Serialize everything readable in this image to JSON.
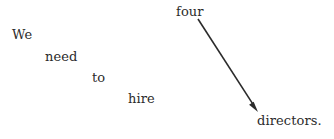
{
  "canvas": {
    "width": 334,
    "height": 139,
    "background_color": "#ffffff",
    "text_color": "#2b2b2b"
  },
  "sentence": {
    "full_text": "We need to hire four directors.",
    "words": [
      {
        "id": "we",
        "text": "We",
        "x": 12,
        "y": 28,
        "font_size": 13
      },
      {
        "id": "need",
        "text": "need",
        "x": 45,
        "y": 50,
        "font_size": 13
      },
      {
        "id": "to",
        "text": "to",
        "x": 92,
        "y": 71,
        "font_size": 13
      },
      {
        "id": "hire",
        "text": "hire",
        "x": 128,
        "y": 92,
        "font_size": 13
      },
      {
        "id": "four",
        "text": "four",
        "x": 176,
        "y": 5,
        "font_size": 13
      },
      {
        "id": "directors",
        "text": "directors.",
        "x": 257,
        "y": 114,
        "font_size": 13
      }
    ]
  },
  "arrow": {
    "id": "four-to-directors-arrow",
    "from_word": "four",
    "to_word": "directors",
    "start_x": 198,
    "start_y": 19,
    "end_x": 258,
    "end_y": 112,
    "stroke_color": "#2b2b2b",
    "stroke_width": 1.6,
    "head_length": 11,
    "head_width": 7
  }
}
